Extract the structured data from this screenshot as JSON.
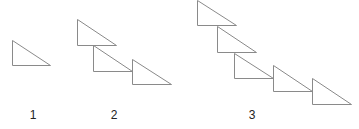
{
  "figures": [
    {
      "label": "1",
      "label_x": 23,
      "triangles": [
        [
          12,
          40,
          50,
          65
        ]
      ]
    },
    {
      "label": "2",
      "label_x": 104,
      "triangles": [
        [
          77,
          19,
          116,
          45
        ],
        [
          93,
          45,
          132,
          71
        ],
        [
          132,
          59,
          171,
          84
        ]
      ]
    },
    {
      "label": "3",
      "label_x": 242,
      "triangles": [
        [
          197,
          0,
          236,
          25
        ],
        [
          217,
          26,
          256,
          52
        ],
        [
          234,
          53,
          273,
          78
        ],
        [
          273,
          65,
          312,
          91
        ],
        [
          312,
          78,
          351,
          104
        ]
      ]
    }
  ],
  "stroke_color": "#8a8a8a"
}
